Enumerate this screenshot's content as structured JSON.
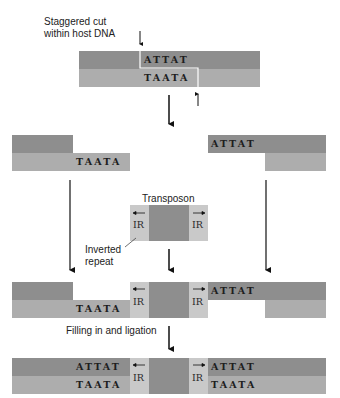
{
  "labels": {
    "staggered_cut": [
      "Staggered cut",
      "within host DNA"
    ],
    "transposon": "Transposon",
    "inverted_repeat": [
      "Inverted",
      "repeat"
    ],
    "filling": "Filling in and ligation",
    "ir": "IR"
  },
  "sequences": {
    "top": "ATTAT",
    "bottom": "TAATA"
  },
  "colors": {
    "top_strand": "#8e8e8e",
    "bottom_strand": "#adadad",
    "inverted_repeat": "#c9c9c9",
    "transposon_core": "#8e8e8e"
  }
}
